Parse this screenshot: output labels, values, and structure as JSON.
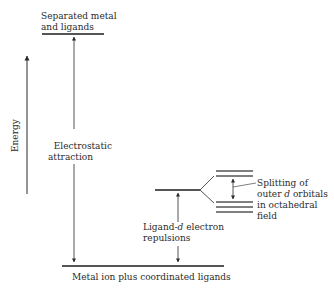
{
  "diagram": {
    "axis_label": "Energy",
    "labels": {
      "top_level": "Separated metal\nand ligands",
      "electrostatic": "Electrostatic\nattraction",
      "ligand_repulsion_1": "Ligand-",
      "ligand_repulsion_d": "d",
      "ligand_repulsion_2": " electron\nrepulsions",
      "splitting_1": "Splitting of\nouter ",
      "splitting_d": "d",
      "splitting_2": " orbitals\nin octahedral\nfield",
      "bottom_level": "Metal ion plus coordinated ligands"
    },
    "levels": [
      {
        "name": "separated-metal-and-ligands",
        "x1": 42,
        "x2": 104,
        "y": 34
      },
      {
        "name": "ligand-d-repulsion-level",
        "x1": 155,
        "x2": 200,
        "y": 190
      },
      {
        "name": "eg-upper-level-1",
        "x1": 216,
        "x2": 253,
        "y": 171
      },
      {
        "name": "eg-upper-level-2",
        "x1": 216,
        "x2": 253,
        "y": 176
      },
      {
        "name": "t2g-lower-level-1",
        "x1": 216,
        "x2": 253,
        "y": 202
      },
      {
        "name": "t2g-lower-level-2",
        "x1": 216,
        "x2": 253,
        "y": 207
      },
      {
        "name": "t2g-lower-level-3",
        "x1": 216,
        "x2": 253,
        "y": 212
      },
      {
        "name": "metal-ion-plus-coordinated-ligands",
        "x1": 62,
        "x2": 224,
        "y": 266
      }
    ],
    "colors": {
      "line": "#3a3a3a",
      "level": "#555555",
      "text": "#2a2a2a"
    }
  }
}
